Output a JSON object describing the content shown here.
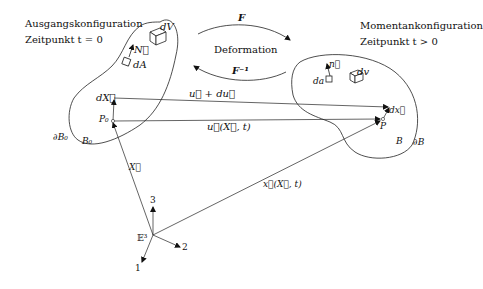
{
  "diagram": {
    "title_left": {
      "line1": "Ausgangskonfiguration",
      "line2": "Zeitpunkt t = 0"
    },
    "title_right": {
      "line1": "Momentankonfiguration",
      "line2": "Zeitpunkt t > 0"
    },
    "deformation": {
      "label": "Deformation",
      "forward_map": "F",
      "inverse_map": "F⁻¹"
    },
    "reference_body": {
      "region": "B₀",
      "boundary": "∂B₀",
      "volume_element": "dV",
      "area_element": "dA",
      "normal": "N⃗",
      "point": "P₀",
      "line_element": "dX⃗"
    },
    "current_body": {
      "region": "B",
      "boundary": "∂B",
      "volume_element": "dv",
      "area_element": "da",
      "normal": "n⃗",
      "point": "P",
      "line_element": "dx⃗"
    },
    "vectors": {
      "position_reference": "X⃗",
      "position_current": "x⃗(X⃗, t)",
      "displacement": "u⃗(X⃗, t)",
      "displacement_increment": "u⃗ + du⃗"
    },
    "coordinate_system": {
      "space": "𝔼³",
      "axes": [
        "1",
        "2",
        "3"
      ]
    }
  }
}
